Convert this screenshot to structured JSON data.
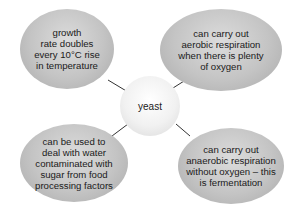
{
  "diagram": {
    "center": {
      "label": "yeast"
    },
    "nodes": [
      {
        "id": "top-left",
        "text": "growth\nrate doubles\nevery 10°C rise\nin temperature"
      },
      {
        "id": "top-right",
        "text": "can carry out\naerobic respiration\nwhen there is plenty\nof oxygen"
      },
      {
        "id": "bottom-left",
        "text": "can be used to\ndeal with water\ncontaminated with\nsugar from food\nprocessing factors"
      },
      {
        "id": "bottom-right",
        "text": "can carry out\nanaerobic respiration\nwithout oxygen – this\nis fermentation"
      }
    ],
    "colors": {
      "bubble": "#c4c4c4",
      "center": "#f1f1f1",
      "connector": "#333333"
    }
  }
}
